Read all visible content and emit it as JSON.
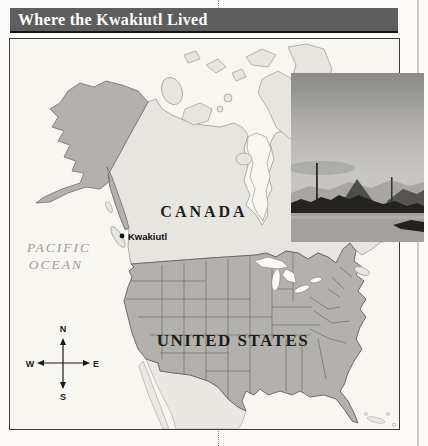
{
  "header": {
    "title": "Where the Kwakiutl Lived"
  },
  "map": {
    "labels": {
      "canada": "CANADA",
      "united_states": "UNITED STATES",
      "pacific_ocean_line1": "PACIFIC",
      "pacific_ocean_line2": "OCEAN",
      "kwakiutl": "Kwakiutl"
    },
    "compass": {
      "n": "N",
      "s": "S",
      "e": "E",
      "w": "W"
    },
    "colors": {
      "header_bar": "#5e5e5e",
      "header_text": "#ffffff",
      "ocean": "#f8f6f1",
      "canada_fill": "#e7e5e0",
      "us_fill": "#b3b1ad",
      "mexico_fill": "#eae8e3",
      "state_border": "#6f6d69",
      "coastline": "#9b9993",
      "ocean_label_gray": "#9c9b98"
    }
  }
}
